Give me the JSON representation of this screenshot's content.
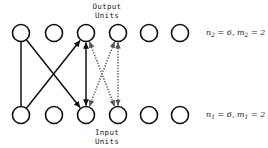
{
  "figure": {
    "width": 268,
    "height": 148,
    "background": "#ffffff"
  },
  "captions": {
    "output_units": "Output\nUnits",
    "input_units": "Input\nUnits"
  },
  "parameters": {
    "top": {
      "n_symbol": "n",
      "n_subscript": "2",
      "n_value": "6",
      "separator": ", ",
      "m_symbol": "m",
      "m_subscript": "2",
      "m_value": "2",
      "equals": " = "
    },
    "bottom": {
      "n_symbol": "n",
      "n_subscript": "1",
      "n_value": "6",
      "separator": ", ",
      "m_symbol": "m",
      "m_subscript": "1",
      "m_value": "2",
      "equals": " = "
    }
  },
  "colors": {
    "node_stroke": "#111111",
    "node_fill": "#ffffff",
    "edge_solid": "#111111",
    "edge_dotted": "#555555",
    "text": "#1a1a1a"
  },
  "diagram": {
    "type": "bipartite-network",
    "node_radius": 8.5,
    "rows": [
      {
        "id": "output-row",
        "label": "Output Units",
        "cy": 33,
        "nodes": [
          {
            "index": 1,
            "cx": 21
          },
          {
            "index": 2,
            "cx": 54
          },
          {
            "index": 3,
            "cx": 86
          },
          {
            "index": 4,
            "cx": 118
          },
          {
            "index": 5,
            "cx": 149
          },
          {
            "index": 6,
            "cx": 180
          }
        ]
      },
      {
        "id": "input-row",
        "label": "Input Units",
        "cy": 115,
        "nodes": [
          {
            "index": 1,
            "cx": 21
          },
          {
            "index": 2,
            "cx": 54
          },
          {
            "index": 3,
            "cx": 86
          },
          {
            "index": 4,
            "cx": 118
          },
          {
            "index": 5,
            "cx": 149
          },
          {
            "index": 6,
            "cx": 180
          }
        ]
      }
    ],
    "edges": [
      {
        "id": "e1",
        "from_row": "output",
        "from_index": 1,
        "to_row": "input",
        "to_index": 1,
        "style": "solid",
        "arrow_start": false,
        "arrow_end": false
      },
      {
        "id": "e2",
        "from_row": "output",
        "from_index": 1,
        "to_row": "input",
        "to_index": 3,
        "style": "solid",
        "arrow_start": false,
        "arrow_end": true
      },
      {
        "id": "e3",
        "from_row": "output",
        "from_index": 3,
        "to_row": "input",
        "to_index": 1,
        "style": "solid",
        "arrow_start": true,
        "arrow_end": false
      },
      {
        "id": "e4",
        "from_row": "output",
        "from_index": 3,
        "to_row": "input",
        "to_index": 3,
        "style": "solid",
        "arrow_start": true,
        "arrow_end": true
      },
      {
        "id": "e5",
        "from_row": "output",
        "from_index": 3,
        "to_row": "input",
        "to_index": 4,
        "style": "dotted",
        "arrow_start": true,
        "arrow_end": true
      },
      {
        "id": "e6",
        "from_row": "output",
        "from_index": 4,
        "to_row": "input",
        "to_index": 3,
        "style": "dotted",
        "arrow_start": true,
        "arrow_end": true
      },
      {
        "id": "e7",
        "from_row": "output",
        "from_index": 4,
        "to_row": "input",
        "to_index": 4,
        "style": "dotted",
        "arrow_start": true,
        "arrow_end": true
      }
    ]
  }
}
